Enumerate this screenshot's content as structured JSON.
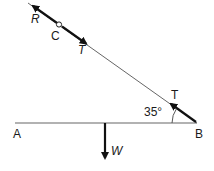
{
  "diagram": {
    "labels": {
      "A": "A",
      "B": "B",
      "C": "C",
      "R": "R",
      "T_upper": "T",
      "T_lower": "T",
      "W": "W",
      "angle": "35°"
    },
    "angle_deg": 35,
    "colors": {
      "line": "#555555",
      "arrow": "#111111",
      "background": "#ffffff"
    }
  }
}
